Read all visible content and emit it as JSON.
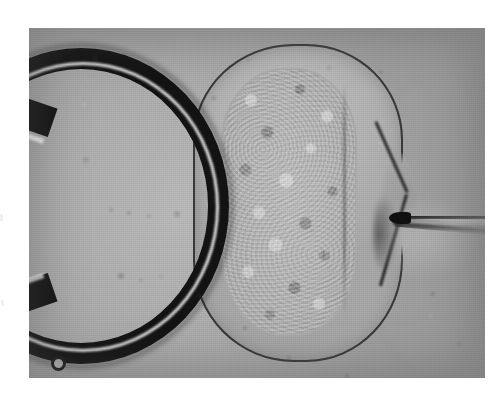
{
  "figure": {
    "domain": "Natural-Image",
    "kind": "photomicrograph",
    "caption": "",
    "color_mode": "grayscale",
    "plate": {
      "left": 29,
      "top": 28,
      "width": 456,
      "height": 350,
      "paper_background": "#ffffff",
      "field_background": "#a8a8a8",
      "texture": "halftone-scan-lines"
    },
    "colors": {
      "paper_white": "#ffffff",
      "field_gray": "#a8a8a8",
      "pipette_black": "#131313",
      "pipette_highlight": "#fafafa",
      "zona_gray": "#b6b6b6",
      "cytoplasm_gray": "#b0b0b0",
      "outline_dark": "#262626",
      "needle_dark": "#101010"
    }
  },
  "scene": {
    "objects": [
      {
        "id": "holding-pipette",
        "label": "Holding pipette",
        "description": "Thick dark curved glass holding pipette forming a blunt loop entering from the left side of the field",
        "position": "left",
        "tone": "black"
      },
      {
        "id": "droplet",
        "label": "Droplet",
        "description": "Small round bubble adhering to the lower limb of the holding pipette",
        "position": "lower-left",
        "tone": "dark ring, light centre"
      },
      {
        "id": "oocyte",
        "label": "Oocyte",
        "description": "Large peanut / hourglass shaped cell with granular cytoplasm and a surrounding zona pellucida, deformed at its right margin",
        "position": "centre",
        "tone": "mid gray, granular"
      },
      {
        "id": "zona-pellucida",
        "label": "Zona pellucida",
        "description": "Translucent outer envelope with a dark outline, indented into a V notch where the needle presses",
        "position": "centre outline",
        "tone": "light gray with dark edge"
      },
      {
        "id": "cytoplasm",
        "label": "Cytoplasm",
        "description": "Coarse granular interior of the cell filling the central column",
        "position": "centre",
        "tone": "mottled gray"
      },
      {
        "id": "injection-needle",
        "label": "Injection needle",
        "description": "Fine tapered micropipette entering horizontally from the right and denting the cell membrane at its tip",
        "position": "right",
        "tone": "dark tip, translucent shaft"
      }
    ]
  },
  "annotations": {
    "labels": [],
    "scale_bar": null,
    "text_overlay": ""
  },
  "specks": [
    {
      "x": 66,
      "y": 30,
      "r": 3.0
    },
    {
      "x": 132,
      "y": 60,
      "r": 2.5
    },
    {
      "x": 185,
      "y": 70,
      "r": 2.0
    },
    {
      "x": 57,
      "y": 132,
      "r": 2.8
    },
    {
      "x": 82,
      "y": 182,
      "r": 2.2
    },
    {
      "x": 100,
      "y": 185,
      "r": 2.4
    },
    {
      "x": 120,
      "y": 188,
      "r": 2.0
    },
    {
      "x": 148,
      "y": 186,
      "r": 2.6
    },
    {
      "x": 92,
      "y": 248,
      "r": 3.2
    },
    {
      "x": 112,
      "y": 252,
      "r": 2.4
    },
    {
      "x": 170,
      "y": 268,
      "r": 2.2
    },
    {
      "x": 216,
      "y": 300,
      "r": 2.0
    },
    {
      "x": 300,
      "y": 40,
      "r": 2.4
    },
    {
      "x": 352,
      "y": 44,
      "r": 2.0
    },
    {
      "x": 404,
      "y": 266,
      "r": 2.4
    },
    {
      "x": 430,
      "y": 316,
      "r": 2.0
    },
    {
      "x": 260,
      "y": 330,
      "r": 2.2
    },
    {
      "x": 318,
      "y": 348,
      "r": 2.0
    }
  ]
}
